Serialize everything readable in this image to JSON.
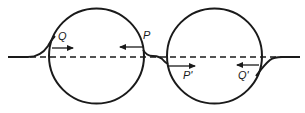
{
  "diagram": {
    "colors": {
      "stroke": "#1a1a1a",
      "background": "#ffffff"
    },
    "circles": [
      {
        "name": "left-circle",
        "cx": 96.5,
        "cy": 56,
        "r": 47.5
      },
      {
        "name": "right-circle",
        "cx": 214.5,
        "cy": 56,
        "r": 47.5
      }
    ],
    "axis": {
      "y": 57,
      "x1": 30,
      "x2": 282,
      "style": "dashed"
    },
    "labels": {
      "Q": "Q",
      "P": "P",
      "P_prime": "P'",
      "Q_prime": "Q'"
    },
    "arrows": [
      {
        "name": "arrow-Q",
        "label": "Q",
        "direction": "right"
      },
      {
        "name": "arrow-P",
        "label": "P",
        "direction": "left"
      },
      {
        "name": "arrow-P-prime",
        "label": "P'",
        "direction": "right"
      },
      {
        "name": "arrow-Q-prime",
        "label": "Q'",
        "direction": "left"
      }
    ]
  }
}
